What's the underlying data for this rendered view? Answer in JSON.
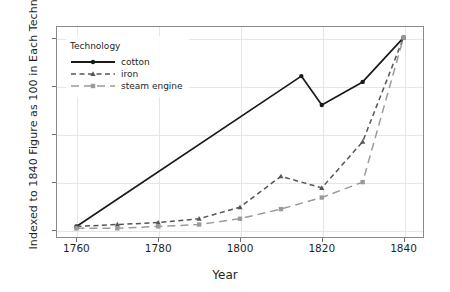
{
  "chart_data": {
    "type": "line",
    "title": "",
    "xlabel": "Year",
    "ylabel": "Indexed to 1840 Figure as 100 in Each Technology",
    "xlim": [
      1755,
      1845
    ],
    "ylim": [
      -4,
      106
    ],
    "xticks": [
      1760,
      1780,
      1800,
      1820,
      1840
    ],
    "yticks": [
      0,
      25,
      50,
      75,
      100
    ],
    "grid": true,
    "legend": {
      "title": "Technology",
      "position": "top-left",
      "entries": [
        "cotton",
        "iron",
        "steam engine"
      ]
    },
    "x": [
      1760,
      1770,
      1780,
      1790,
      1800,
      1810,
      1815,
      1820,
      1830,
      1840
    ],
    "series": [
      {
        "name": "cotton",
        "color": "#1a1a1a",
        "dash": "solid",
        "marker": "circle",
        "x": [
          1760,
          1815,
          1820,
          1830,
          1840
        ],
        "values": [
          2,
          80,
          65,
          77,
          100
        ]
      },
      {
        "name": "iron",
        "color": "#555555",
        "dash": "dashed",
        "marker": "triangle",
        "x": [
          1760,
          1770,
          1780,
          1790,
          1800,
          1810,
          1820,
          1830,
          1840
        ],
        "values": [
          2,
          3,
          4,
          6,
          12,
          28,
          22,
          46,
          100
        ]
      },
      {
        "name": "steam engine",
        "color": "#9a9a9a",
        "dash": "longdash",
        "marker": "square",
        "x": [
          1760,
          1770,
          1780,
          1790,
          1800,
          1810,
          1820,
          1830,
          1840
        ],
        "values": [
          1,
          1,
          2,
          3,
          6,
          11,
          17,
          25,
          100
        ]
      }
    ]
  },
  "axis": {
    "ytick_labels": [
      "0",
      "25",
      "50",
      "75",
      "100"
    ],
    "xtick_labels": [
      "1760",
      "1780",
      "1800",
      "1820",
      "1840"
    ],
    "xlabel": "Year",
    "ylabel": "Indexed to 1840 Figure as 100 in Each Technology"
  },
  "legend": {
    "title": "Technology",
    "items": [
      {
        "label": "cotton"
      },
      {
        "label": "iron"
      },
      {
        "label": "steam engine"
      }
    ]
  }
}
